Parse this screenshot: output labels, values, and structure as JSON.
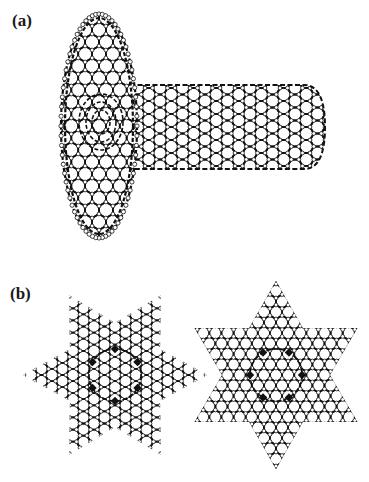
{
  "figure": {
    "panels": [
      {
        "label": "(a)",
        "description": "Carbon nanotube attached to a fullerene-like disk (T-junction / ring structure)",
        "structures": [
          {
            "type": "ellipsoid-cage",
            "cx": 99,
            "cy": 126,
            "rx": 38,
            "ry": 112
          },
          {
            "type": "nanotube",
            "x1": 130,
            "x2": 325,
            "cy": 127,
            "radius": 42
          }
        ]
      },
      {
        "label": "(b)",
        "description": "Two six-pointed star-shaped graphene flakes with heptagon/pentagon defect rings",
        "structures": [
          {
            "type": "hexagram",
            "cx": 115,
            "cy": 375,
            "outer": 92,
            "inner": 52,
            "rotation_deg": 0
          },
          {
            "type": "hexagram",
            "cx": 276,
            "cy": 375,
            "outer": 94,
            "inner": 54,
            "rotation_deg": 90
          }
        ]
      }
    ],
    "style": {
      "bond_color": "#111111",
      "atom_fill": "#ffffff",
      "atom_stroke": "#111111",
      "background": "#ffffff"
    }
  }
}
